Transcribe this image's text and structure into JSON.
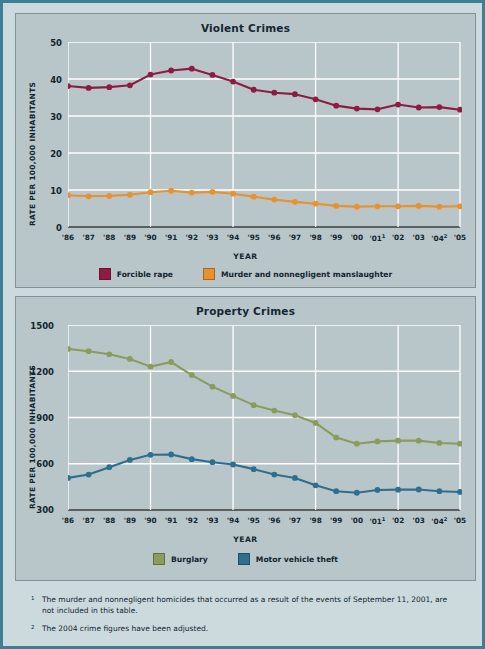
{
  "colors": {
    "page_background": "#ccdade",
    "panel_background": "#b9c6c9",
    "frame_border": "#3d7f96",
    "grid": "#ffffff",
    "axis": "#3c3c3c",
    "text": "#11252f",
    "forcible_rape": "#8e1c42",
    "murder": "#e8912f",
    "burglary": "#8a9c5b",
    "motor_vehicle_theft": "#2e6e8e"
  },
  "violent": {
    "title": "Violent Crimes",
    "ylabel": "RATE PER 100,000 INHABITANTS",
    "xlabel": "YEAR",
    "legend": [
      {
        "label": "Forcible rape",
        "color": "#8e1c42"
      },
      {
        "label": "Murder and nonnegligent manslaughter",
        "color": "#e8912f"
      }
    ]
  },
  "property": {
    "title": "Property Crimes",
    "ylabel": "RATE PER 100,000 INHABITANTS",
    "xlabel": "YEAR",
    "legend": [
      {
        "label": "Burglary",
        "color": "#8a9c5b"
      },
      {
        "label": "Motor vehicle theft",
        "color": "#2e6e8e"
      }
    ]
  },
  "xtick_labels": [
    {
      "text": "'86",
      "footnote": ""
    },
    {
      "text": "'87",
      "footnote": ""
    },
    {
      "text": "'88",
      "footnote": ""
    },
    {
      "text": "'89",
      "footnote": ""
    },
    {
      "text": "'90",
      "footnote": ""
    },
    {
      "text": "'91",
      "footnote": ""
    },
    {
      "text": "'92",
      "footnote": ""
    },
    {
      "text": "'93",
      "footnote": ""
    },
    {
      "text": "'94",
      "footnote": ""
    },
    {
      "text": "'95",
      "footnote": ""
    },
    {
      "text": "'96",
      "footnote": ""
    },
    {
      "text": "'97",
      "footnote": ""
    },
    {
      "text": "'98",
      "footnote": ""
    },
    {
      "text": "'99",
      "footnote": ""
    },
    {
      "text": "'00",
      "footnote": ""
    },
    {
      "text": "'01",
      "footnote": "1"
    },
    {
      "text": "'02",
      "footnote": ""
    },
    {
      "text": "'03",
      "footnote": ""
    },
    {
      "text": "'04",
      "footnote": "2"
    },
    {
      "text": "'05",
      "footnote": ""
    }
  ],
  "notes": [
    {
      "marker": "1",
      "text": "The murder and nonnegligent homicides that occurred as a result of the events of September 11, 2001, are not included in this table."
    },
    {
      "marker": "2",
      "text": "The 2004 crime figures have been adjusted."
    }
  ],
  "chart_data": [
    {
      "type": "line",
      "title": "Violent Crimes",
      "xlabel": "YEAR",
      "ylabel": "RATE PER 100,000 INHABITANTS",
      "categories": [
        "'86",
        "'87",
        "'88",
        "'89",
        "'90",
        "'91",
        "'92",
        "'93",
        "'94",
        "'95",
        "'96",
        "'97",
        "'98",
        "'99",
        "'00",
        "'01",
        "'02",
        "'03",
        "'04",
        "'05"
      ],
      "ylim": [
        0,
        50
      ],
      "yticks": [
        0,
        10,
        20,
        30,
        40,
        50
      ],
      "grid": true,
      "legend_position": "bottom",
      "series": [
        {
          "name": "Forcible rape",
          "color": "#8e1c42",
          "values": [
            38.1,
            37.6,
            37.8,
            38.3,
            41.2,
            42.3,
            42.8,
            41.1,
            39.3,
            37.1,
            36.3,
            35.9,
            34.5,
            32.8,
            32.0,
            31.8,
            33.1,
            32.3,
            32.4,
            31.7
          ]
        },
        {
          "name": "Murder and nonnegligent manslaughter",
          "color": "#e8912f",
          "values": [
            8.6,
            8.3,
            8.4,
            8.7,
            9.4,
            9.8,
            9.3,
            9.5,
            9.0,
            8.2,
            7.4,
            6.8,
            6.3,
            5.7,
            5.5,
            5.6,
            5.6,
            5.7,
            5.5,
            5.6
          ]
        }
      ]
    },
    {
      "type": "line",
      "title": "Property Crimes",
      "xlabel": "YEAR",
      "ylabel": "RATE PER 100,000 INHABITANTS",
      "categories": [
        "'86",
        "'87",
        "'88",
        "'89",
        "'90",
        "'91",
        "'92",
        "'93",
        "'94",
        "'95",
        "'96",
        "'97",
        "'98",
        "'99",
        "'00",
        "'01",
        "'02",
        "'03",
        "'04",
        "'05"
      ],
      "ylim": [
        300,
        1500
      ],
      "yticks": [
        300,
        600,
        900,
        1200,
        1500
      ],
      "grid": true,
      "legend_position": "bottom",
      "series": [
        {
          "name": "Burglary",
          "color": "#8a9c5b",
          "values": [
            1345,
            1330,
            1310,
            1280,
            1230,
            1260,
            1175,
            1100,
            1040,
            980,
            945,
            915,
            865,
            770,
            730,
            745,
            750,
            750,
            735,
            730
          ]
        },
        {
          "name": "Motor vehicle theft",
          "color": "#2e6e8e",
          "values": [
            508,
            530,
            578,
            625,
            658,
            660,
            630,
            610,
            595,
            565,
            530,
            508,
            460,
            422,
            412,
            430,
            432,
            433,
            422,
            417
          ]
        }
      ]
    }
  ]
}
